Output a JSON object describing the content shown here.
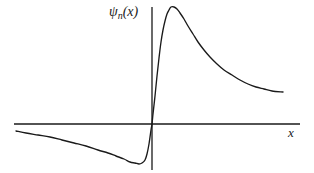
{
  "figure": {
    "title": "",
    "background_color": "#ffffff",
    "line_color": "#1a1a1a",
    "axis_color": "#1a1a1a",
    "y_axis_label_symbol": "ψ",
    "y_axis_label_subscript": "n",
    "y_axis_label_suffix": "(x)",
    "x_axis_label": "x"
  },
  "chart_data": {
    "type": "line",
    "title": "",
    "subtitle": "",
    "xlabel": "x",
    "ylabel": "ψn(x)",
    "grid": false,
    "legend": null,
    "axes": {
      "x_axis": {
        "drawn": true,
        "y_value": 0,
        "x_start_px": 14,
        "x_end_px": 300,
        "y_px": 124
      },
      "y_axis": {
        "drawn": true,
        "x_value": 0,
        "y_top_px": 7,
        "y_bottom_px": 170,
        "x_px": 152
      },
      "xlim": [
        -1.0,
        1.05
      ],
      "ylim": [
        -0.32,
        1.0
      ],
      "tick_labels_x": [],
      "tick_labels_y": []
    },
    "features": {
      "zero_crossing_x": 0.0,
      "minimum": {
        "x": -0.48,
        "y": -0.25
      },
      "maximum": {
        "x": 0.14,
        "y": 0.96
      },
      "left_tail_start": {
        "x": -0.95,
        "y": -0.04
      },
      "right_tail_end": {
        "x": 0.92,
        "y": 0.2
      }
    },
    "series": [
      {
        "name": "psi_n(x)",
        "color": "#1a1a1a",
        "points_px": [
          [
            16,
            131
          ],
          [
            26,
            133
          ],
          [
            38,
            135
          ],
          [
            50,
            137
          ],
          [
            62,
            140
          ],
          [
            74,
            143
          ],
          [
            86,
            146
          ],
          [
            98,
            150
          ],
          [
            108,
            153
          ],
          [
            116,
            156
          ],
          [
            124,
            159
          ],
          [
            130,
            162
          ],
          [
            135,
            163
          ],
          [
            139,
            164
          ],
          [
            142,
            163
          ],
          [
            145,
            160
          ],
          [
            147,
            154
          ],
          [
            149,
            144
          ],
          [
            151,
            130
          ],
          [
            152,
            124
          ],
          [
            153,
            114
          ],
          [
            155,
            96
          ],
          [
            157,
            76
          ],
          [
            159,
            58
          ],
          [
            161,
            42
          ],
          [
            163,
            30
          ],
          [
            165,
            21
          ],
          [
            167,
            14
          ],
          [
            169,
            10
          ],
          [
            171,
            7
          ],
          [
            174,
            7
          ],
          [
            177,
            9
          ],
          [
            180,
            13
          ],
          [
            184,
            19
          ],
          [
            188,
            26
          ],
          [
            193,
            34
          ],
          [
            198,
            42
          ],
          [
            204,
            50
          ],
          [
            210,
            57
          ],
          [
            217,
            64
          ],
          [
            224,
            70
          ],
          [
            232,
            75
          ],
          [
            240,
            80
          ],
          [
            248,
            84
          ],
          [
            256,
            87
          ],
          [
            264,
            89
          ],
          [
            272,
            91
          ],
          [
            283,
            92
          ]
        ]
      }
    ]
  }
}
